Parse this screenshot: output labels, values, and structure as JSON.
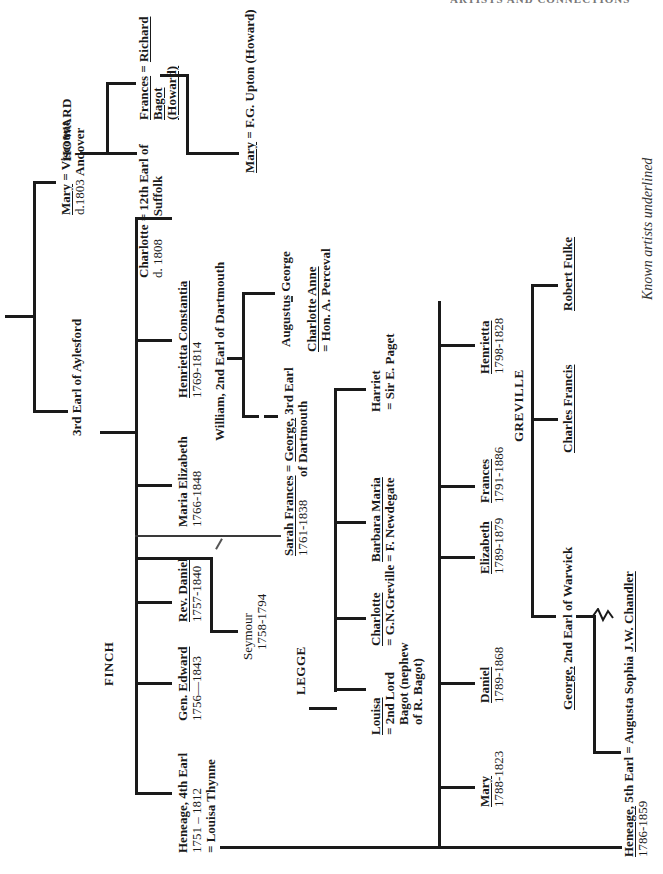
{
  "header": {
    "clipped_text": "ARTISTS AND CONNECTIONS"
  },
  "note": "Known artists underlined",
  "families": {
    "howard": "HOWARD",
    "finch": "FINCH",
    "legge": "LEGGE",
    "greville": "GREVILLE"
  },
  "people": {
    "aylesford": {
      "name": "3rd Earl of Aylesford"
    },
    "mary_andover": {
      "name": "Mary",
      "eq": " = ",
      "spouse": "Viscount",
      "spouse2": "Andover",
      "dates": "d.1803"
    },
    "charlotte_suffolk": {
      "name": "Charlotte",
      "eq": " = ",
      "spouse": "12th Earl of",
      "spouse2": "Suffolk",
      "dates": "d. 1808"
    },
    "frances_bagot": {
      "name": "Frances",
      "eq": " = ",
      "spouse": "Richard",
      "spouse2": "Bagot",
      "spouse3": "(Howard)"
    },
    "mary_upton": {
      "name": "Mary",
      "eq": " = ",
      "spouse": "F.G. Upton (Howard)"
    },
    "henrietta_constantia": {
      "name": "Henrietta Constantia",
      "dates": "1769-1814"
    },
    "william_dartmouth": {
      "name": "William, 2nd Earl of Dartmouth"
    },
    "augustus_george": {
      "name": "Augustus George"
    },
    "charlotte_anne": {
      "name": "Charlotte Anne",
      "spouse": "= Hon. A. Perceval"
    },
    "george_3rd_dartmouth": {
      "name": "George,",
      "rest": " 3rd Earl",
      "line2": "of Dartmouth"
    },
    "maria_elizabeth": {
      "name": "Maria Elizabeth",
      "dates": "1766-1848"
    },
    "sarah_frances": {
      "name": "Sarah Frances",
      "eq": " = ",
      "dates": "1761-1838"
    },
    "rev_daniel": {
      "name": "Rev. Daniel",
      "dates": "1757-1840"
    },
    "seymour": {
      "name": "Seymour",
      "dates": "1758-1794"
    },
    "gen_edward": {
      "prefix": "Gen. ",
      "name": "Edward",
      "dates": "1756—1843"
    },
    "heneage_4th": {
      "name": "Heneage, 4th Earl",
      "dates": "1751 – 1812",
      "spouse": "= Louisa Thynne"
    },
    "harriet": {
      "name": "Harriet",
      "spouse": "= Sir E. Paget"
    },
    "barbara_maria": {
      "name": "Barbara Maria",
      "spouse": "= F. Newdegate"
    },
    "charlotte_greville": {
      "name": "Charlotte",
      "spouse": "= G.N.Greville"
    },
    "louisa_bagot": {
      "name": "Louisa",
      "spouse": "= 2nd Lord",
      "line3": "Bagot (nephew",
      "line4": "of R. Bagot)"
    },
    "henrietta": {
      "name": "Henrietta",
      "dates": "1798-1828"
    },
    "frances": {
      "name": "Frances",
      "dates": "1791-1886"
    },
    "elizabeth": {
      "name": "Elizabeth",
      "dates": "1789-1879"
    },
    "daniel": {
      "name": "Daniel",
      "dates": "1789-1868"
    },
    "mary": {
      "name": "Mary",
      "dates": "1788-1823"
    },
    "heneage_5th": {
      "name": "Heneage,",
      "rest": " 5th Earl = Augusta Sophia",
      "dates": "1786-1859"
    },
    "robert_fulke": {
      "name": "Robert Fulke"
    },
    "charles_francis": {
      "name": "Charles Francis"
    },
    "george_warwick": {
      "name": "George,",
      "rest": " 2nd Earl of Warwick"
    },
    "jw_chandler": {
      "name": "J.W. Chandler"
    }
  }
}
